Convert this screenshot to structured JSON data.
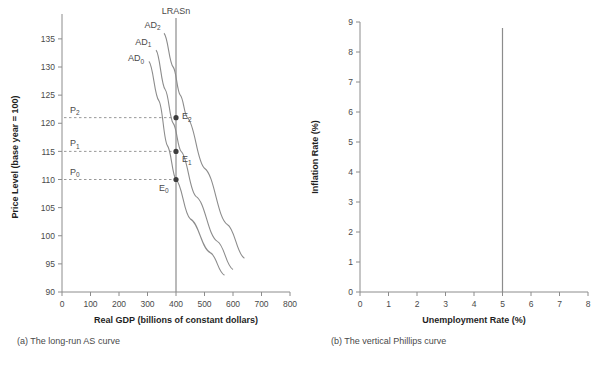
{
  "figure": {
    "panels": [
      {
        "id": "a",
        "caption": "(a) The long-run AS curve",
        "xlabel": "Real GDP (billions of constant dollars)",
        "ylabel": "Price Level (base year = 100)"
      },
      {
        "id": "b",
        "caption": "(b) The vertical Phillips curve",
        "xlabel": "Unemployment Rate (%)",
        "ylabel": "Inflation Rate (%)"
      }
    ]
  },
  "chart_data": [
    {
      "type": "line",
      "id": "long-run-as",
      "title": "(a) The long-run AS curve",
      "xlabel": "Real GDP (billions of constant dollars)",
      "ylabel": "Price Level (base year = 100)",
      "xlim": [
        0,
        800
      ],
      "ylim": [
        90,
        138
      ],
      "xticks": [
        0,
        100,
        200,
        300,
        400,
        500,
        600,
        700,
        800
      ],
      "yticks": [
        90,
        95,
        100,
        105,
        110,
        115,
        120,
        125,
        130,
        135
      ],
      "grid": false,
      "legend": "none",
      "vertical_line": {
        "label": "LRASn",
        "x": 400,
        "note": "long-run aggregate supply at natural real GDP"
      },
      "series": [
        {
          "name": "AD0",
          "label": "AD₀",
          "label_x": 260,
          "label_y": 131,
          "points": [
            {
              "x": 305,
              "y": 131
            },
            {
              "x": 340,
              "y": 124
            },
            {
              "x": 370,
              "y": 116
            },
            {
              "x": 400,
              "y": 110
            },
            {
              "x": 450,
              "y": 103
            },
            {
              "x": 520,
              "y": 97
            },
            {
              "x": 570,
              "y": 93
            }
          ]
        },
        {
          "name": "AD1",
          "label": "AD₁",
          "label_x": 285,
          "label_y": 134,
          "points": [
            {
              "x": 330,
              "y": 133
            },
            {
              "x": 362,
              "y": 126
            },
            {
              "x": 390,
              "y": 120
            },
            {
              "x": 418,
              "y": 115
            },
            {
              "x": 470,
              "y": 107
            },
            {
              "x": 545,
              "y": 99
            },
            {
              "x": 600,
              "y": 94
            }
          ]
        },
        {
          "name": "AD2",
          "label": "AD₂",
          "label_x": 318,
          "label_y": 137,
          "points": [
            {
              "x": 358,
              "y": 136
            },
            {
              "x": 390,
              "y": 130
            },
            {
              "x": 415,
              "y": 125
            },
            {
              "x": 440,
              "y": 121
            },
            {
              "x": 500,
              "y": 112
            },
            {
              "x": 580,
              "y": 102
            },
            {
              "x": 640,
              "y": 96
            }
          ]
        }
      ],
      "equilibria": [
        {
          "label": "E₂",
          "x": 400,
          "y": 121,
          "price_label": "P₂",
          "dot": true
        },
        {
          "label": "E₁",
          "x": 400,
          "y": 115,
          "price_label": "P₁",
          "dot": true
        },
        {
          "label": "E₀",
          "x": 400,
          "y": 110,
          "price_label": "P₀",
          "dot": true
        }
      ],
      "price_levels": [
        {
          "label": "P₂",
          "value": 121
        },
        {
          "label": "P₁",
          "value": 115
        },
        {
          "label": "P₀",
          "value": 110
        }
      ],
      "annotations": [
        "LRASn",
        "AD₀",
        "AD₁",
        "AD₂",
        "E₀",
        "E₁",
        "E₂",
        "P₀",
        "P₁",
        "P₂"
      ]
    },
    {
      "type": "line",
      "id": "vertical-phillips",
      "title": "(b) The vertical Phillips curve",
      "xlabel": "Unemployment Rate (%)",
      "ylabel": "Inflation Rate (%)",
      "xlim": [
        0,
        8
      ],
      "ylim": [
        0,
        9
      ],
      "xticks": [
        0,
        1,
        2,
        3,
        4,
        5,
        6,
        7,
        8
      ],
      "yticks": [
        0,
        1,
        2,
        3,
        4,
        5,
        6,
        7,
        8,
        9
      ],
      "grid": false,
      "legend": "none",
      "vertical_line": {
        "label": "",
        "x": 5,
        "y_from": 0,
        "y_to": 8.8,
        "note": "natural rate of unemployment"
      },
      "series": [],
      "annotations": []
    }
  ]
}
